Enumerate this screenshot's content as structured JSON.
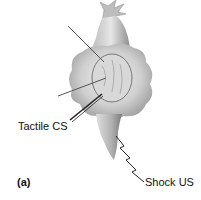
{
  "figure": {
    "panel_label": "(a)",
    "labels": {
      "tactile": "Tactile CS",
      "shock": "Shock US"
    }
  }
}
